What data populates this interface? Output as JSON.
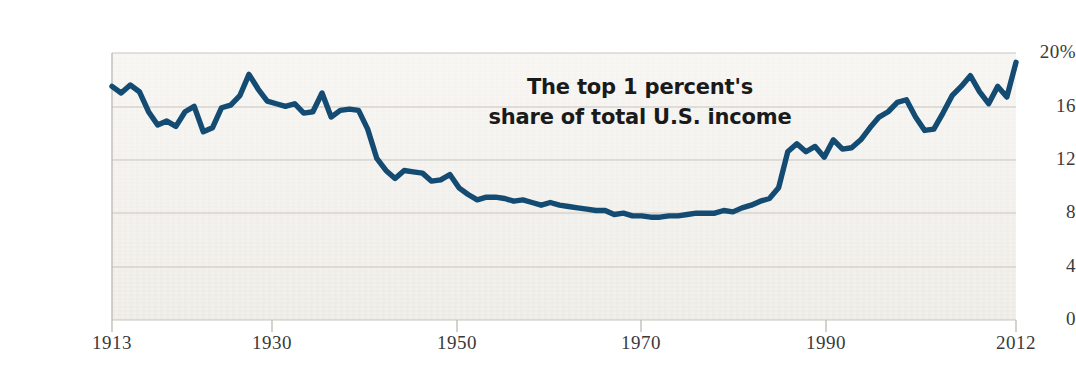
{
  "chart_data": {
    "type": "line",
    "title": "The top 1 percent's share of total U.S. income",
    "title_line_1": "The top 1 percent's",
    "title_line_2": "share of total U.S. income",
    "xlabel": "",
    "ylabel": "",
    "xlim": [
      1913,
      2012
    ],
    "ylim": [
      0,
      20
    ],
    "grid": true,
    "legend": null,
    "line_color": "#134B72",
    "background_color": "#f0eee8",
    "y_ticks": [
      "20%",
      "16",
      "12",
      "8",
      "4",
      "0"
    ],
    "y_tick_values": [
      20,
      16,
      12,
      8,
      4,
      0
    ],
    "x_ticks": [
      "1913",
      "1930",
      "1950",
      "1970",
      "1990",
      "2012"
    ],
    "x_tick_values": [
      1913,
      1930,
      1950,
      1970,
      1990,
      2012
    ],
    "series_name": "Top 1 percent share of total U.S. income",
    "x": [
      1913,
      1914,
      1915,
      1916,
      1917,
      1918,
      1919,
      1920,
      1921,
      1922,
      1923,
      1924,
      1925,
      1926,
      1927,
      1928,
      1929,
      1930,
      1931,
      1932,
      1933,
      1934,
      1935,
      1936,
      1937,
      1938,
      1939,
      1940,
      1941,
      1942,
      1943,
      1944,
      1945,
      1946,
      1947,
      1948,
      1949,
      1950,
      1951,
      1952,
      1953,
      1954,
      1955,
      1956,
      1957,
      1958,
      1959,
      1960,
      1961,
      1962,
      1963,
      1964,
      1965,
      1966,
      1967,
      1968,
      1969,
      1970,
      1971,
      1972,
      1973,
      1974,
      1975,
      1976,
      1977,
      1978,
      1979,
      1980,
      1981,
      1982,
      1983,
      1984,
      1985,
      1986,
      1987,
      1988,
      1989,
      1990,
      1991,
      1992,
      1993,
      1994,
      1995,
      1996,
      1997,
      1998,
      1999,
      2000,
      2001,
      2002,
      2003,
      2004,
      2005,
      2006,
      2007,
      2008,
      2009,
      2010,
      2011,
      2012
    ],
    "values": [
      17.5,
      17.0,
      17.6,
      17.1,
      15.6,
      14.6,
      14.9,
      14.5,
      15.6,
      16.0,
      14.1,
      14.4,
      15.9,
      16.1,
      16.8,
      18.4,
      17.3,
      16.4,
      16.2,
      16.0,
      16.2,
      15.5,
      15.6,
      17.0,
      15.2,
      15.7,
      15.8,
      15.7,
      14.3,
      12.1,
      11.2,
      10.6,
      11.2,
      11.1,
      11.0,
      10.4,
      10.5,
      10.9,
      9.9,
      9.4,
      9.0,
      9.2,
      9.2,
      9.1,
      8.9,
      9.0,
      8.8,
      8.6,
      8.8,
      8.6,
      8.5,
      8.4,
      8.3,
      8.2,
      8.2,
      7.9,
      8.0,
      7.8,
      7.8,
      7.7,
      7.7,
      7.8,
      7.8,
      7.9,
      8.0,
      8.0,
      8.0,
      8.2,
      8.1,
      8.4,
      8.6,
      8.9,
      9.1,
      9.9,
      12.6,
      13.2,
      12.6,
      13.0,
      12.2,
      13.5,
      12.8,
      12.9,
      13.5,
      14.4,
      15.2,
      15.6,
      16.3,
      16.5,
      15.2,
      14.2,
      14.3,
      15.5,
      16.8,
      17.5,
      18.3,
      17.1,
      16.2,
      17.5,
      16.7,
      19.3
    ]
  },
  "axis": {
    "y_tick_positions_px": [
      53,
      107,
      160,
      213,
      267,
      320
    ],
    "x_tick_positions_px": [
      112,
      272,
      457,
      641,
      826,
      1016
    ]
  }
}
